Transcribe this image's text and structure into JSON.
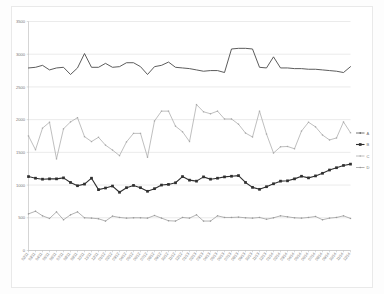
{
  "chart_data": {
    "type": "line",
    "title": "",
    "subtitle": "",
    "xlabel": "",
    "ylabel": "",
    "ylim": [
      0,
      3500
    ],
    "ytick_labels": [
      "3500",
      "3000",
      "2500",
      "2000",
      "1500",
      "1000",
      "500",
      "0"
    ],
    "ytick_values": [
      3500,
      3000,
      2500,
      2000,
      1500,
      1000,
      500,
      0
    ],
    "grid": true,
    "legend_position": "right",
    "x": [
      "02/11",
      "03/11",
      "04/11",
      "05/11",
      "06/11",
      "07/11",
      "08/11",
      "09/11",
      "10/11",
      "11/11",
      "12/11",
      "01/12",
      "02/12",
      "03/12",
      "04/12",
      "05/12",
      "06/12",
      "07/12",
      "08/12",
      "09/12",
      "10/12",
      "11/12",
      "12/12",
      "01/13",
      "02/13",
      "03/13",
      "04/13",
      "05/13",
      "06/13",
      "07/13",
      "08/13",
      "09/13",
      "10/13",
      "11/13",
      "12/13",
      "01/14",
      "02/14",
      "03/14",
      "04/14",
      "05/14",
      "06/14",
      "07/14",
      "08/14",
      "09/14",
      "10/14",
      "11/14",
      "12/14"
    ],
    "series": [
      {
        "name": "A",
        "color": "#4a4a4a",
        "marker": "none",
        "width": 0.9,
        "values": [
          2790,
          2800,
          2830,
          2760,
          2790,
          2800,
          2690,
          2790,
          3010,
          2800,
          2800,
          2860,
          2800,
          2810,
          2870,
          2870,
          2810,
          2690,
          2810,
          2830,
          2880,
          2800,
          2790,
          2780,
          2760,
          2740,
          2750,
          2750,
          2720,
          3080,
          3090,
          3090,
          3080,
          2800,
          2790,
          2960,
          2790,
          2790,
          2780,
          2780,
          2770,
          2770,
          2760,
          2750,
          2740,
          2720,
          2810
        ]
      },
      {
        "name": "B",
        "color": "#2f2f2f",
        "marker": "square",
        "width": 1.1,
        "values": [
          1130,
          1105,
          1090,
          1095,
          1095,
          1110,
          1040,
          990,
          1015,
          1105,
          930,
          955,
          985,
          890,
          960,
          995,
          960,
          905,
          945,
          1000,
          1010,
          1035,
          1130,
          1075,
          1060,
          1125,
          1090,
          1105,
          1125,
          1135,
          1145,
          1040,
          965,
          935,
          975,
          1020,
          1060,
          1065,
          1095,
          1135,
          1110,
          1140,
          1180,
          1230,
          1265,
          1300,
          1320
        ]
      },
      {
        "name": "C",
        "color": "#a9a9a9",
        "marker": "dot",
        "width": 0.75,
        "values": [
          1750,
          1540,
          1870,
          1960,
          1400,
          1860,
          1965,
          2030,
          1740,
          1665,
          1730,
          1610,
          1535,
          1450,
          1660,
          1790,
          1790,
          1425,
          1980,
          2130,
          2130,
          1900,
          1815,
          1665,
          2230,
          2120,
          2090,
          2130,
          2010,
          2010,
          1930,
          1795,
          1735,
          2130,
          1780,
          1490,
          1585,
          1590,
          1555,
          1825,
          1960,
          1890,
          1765,
          1690,
          1720,
          1965,
          1800
        ]
      },
      {
        "name": "D",
        "color": "#9a9a9a",
        "marker": "dot",
        "width": 0.75,
        "values": [
          560,
          600,
          530,
          490,
          590,
          470,
          545,
          590,
          500,
          495,
          485,
          450,
          525,
          505,
          495,
          500,
          500,
          495,
          535,
          495,
          455,
          450,
          505,
          495,
          545,
          450,
          450,
          530,
          505,
          505,
          510,
          500,
          495,
          505,
          478,
          500,
          530,
          515,
          500,
          495,
          505,
          520,
          470,
          495,
          505,
          530,
          490
        ]
      }
    ],
    "legend": [
      {
        "label": "A",
        "color": "#4a4a4a",
        "marker": "dot"
      },
      {
        "label": "B",
        "color": "#2f2f2f",
        "marker": "square"
      },
      {
        "label": "C",
        "color": "#a9a9a9",
        "marker": "dot"
      },
      {
        "label": "D",
        "color": "#9a9a9a",
        "marker": "dot"
      }
    ]
  }
}
